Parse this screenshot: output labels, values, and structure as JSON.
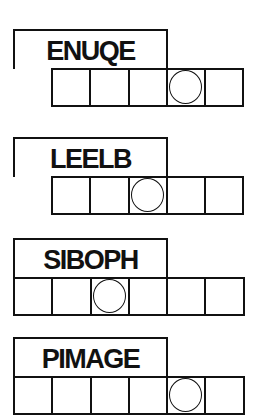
{
  "puzzles": [
    {
      "scrambled": "ENUQE",
      "cell_count": 5,
      "circled_index": 3,
      "answer": [
        "",
        "",
        "",
        "",
        ""
      ],
      "top": 29,
      "cells_left": 51
    },
    {
      "scrambled": "LEELB",
      "cell_count": 5,
      "circled_index": 2,
      "answer": [
        "",
        "",
        "",
        "",
        ""
      ],
      "top": 137,
      "cells_left": 51
    },
    {
      "scrambled": "SIBOPH",
      "cell_count": 6,
      "circled_index": 2,
      "answer": [
        "",
        "",
        "",
        "",
        "",
        ""
      ],
      "top": 238,
      "cells_left": 13
    },
    {
      "scrambled": "PIMAGE",
      "cell_count": 6,
      "circled_index": 4,
      "answer": [
        "",
        "",
        "",
        "",
        "",
        ""
      ],
      "top": 337,
      "cells_left": 13
    }
  ],
  "colors": {
    "ink": "#111111",
    "background": "#ffffff"
  }
}
